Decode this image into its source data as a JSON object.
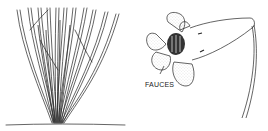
{
  "figure": {
    "left": {
      "subject": "plant-stems-clump",
      "description": "Many slender upright stems arising from a common base at ground line"
    },
    "right": {
      "subject": "tubular-flower",
      "label": "FAUCES",
      "description": "Flower with five rounded stippled lobes, dark throat, and long tube curving to stalk"
    }
  },
  "colors": {
    "ink": "#222222",
    "background": "#ffffff",
    "stipple": "#9a9a9a"
  }
}
